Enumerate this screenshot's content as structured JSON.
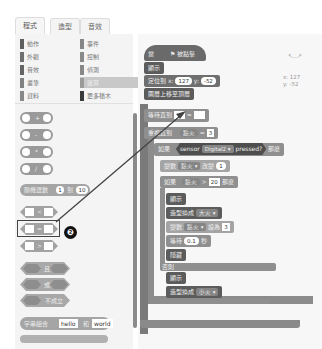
{
  "tabs": [
    {
      "label": "程式",
      "active": true
    },
    {
      "label": "造型",
      "active": false
    },
    {
      "label": "音效",
      "active": false
    }
  ],
  "categories": {
    "left": [
      {
        "label": "動作",
        "color": "#6a6a6a"
      },
      {
        "label": "外觀",
        "color": "#7a7a7a"
      },
      {
        "label": "音效",
        "color": "#6e6e6e"
      },
      {
        "label": "畫筆",
        "color": "#8a8a8a"
      },
      {
        "label": "資料",
        "color": "#909090"
      }
    ],
    "right": [
      {
        "label": "事件",
        "color": "#888888"
      },
      {
        "label": "控制",
        "color": "#8c8c8c"
      },
      {
        "label": "偵測",
        "color": "#8a8a8a"
      },
      {
        "label": "運算",
        "color": "#9a9a9a",
        "selected": true
      },
      {
        "label": "更多積木",
        "color": "#3a3a3a"
      }
    ]
  },
  "palette": {
    "arith_ops": [
      "+",
      "-",
      "*",
      "/"
    ],
    "random": {
      "label": "隨機選數",
      "from": "1",
      "to_label": "到",
      "to": "10"
    },
    "compare_ops": [
      "<",
      "=",
      ">"
    ],
    "logic": [
      "且",
      "或",
      "不成立"
    ],
    "join": {
      "label": "字串組合",
      "a": "hello",
      "and": "和",
      "b": "world"
    },
    "highlight_badge": "❷"
  },
  "script": {
    "hat_label": "當",
    "hat_suffix": "被點擊",
    "blocks": {
      "show1": "顯示",
      "goto_label": "定位到 x:",
      "goto_x": "127",
      "goto_y_label": "y:",
      "goto_y": "-52",
      "front": "圖層上移至頂層",
      "wait_until": "等待直到",
      "eq_op": "=",
      "repeat_label": "重複直到",
      "repeat_var": "點火",
      "repeat_op": "=",
      "repeat_val": "3",
      "if_label": "如果",
      "sensor_label": "sensor",
      "sensor_port": "Digital2",
      "sensor_pressed": "pressed?",
      "then_label": "那麼",
      "change_label": "變數",
      "change_var": "點火",
      "change_by_label": "改變",
      "change_val": "1",
      "if2_label": "如果",
      "if2_var": "點火",
      "if2_op": ">",
      "if2_val": "20",
      "then2_label": "那麼",
      "show2": "顯示",
      "costume_label": "造型換成",
      "costume_val": "大火",
      "set_label": "變數",
      "set_var": "點火",
      "set_to_label": "設為",
      "set_val": "3",
      "wait_label": "等待",
      "wait_val": "0.1",
      "wait_unit": "秒",
      "hide": "隱藏",
      "else_label": "否則",
      "show3": "顯示",
      "costume2_label": "造型換成",
      "costume2_val": "小火"
    }
  },
  "sprite_info": {
    "x_label": "x: 127",
    "y_label": "y: -52"
  }
}
